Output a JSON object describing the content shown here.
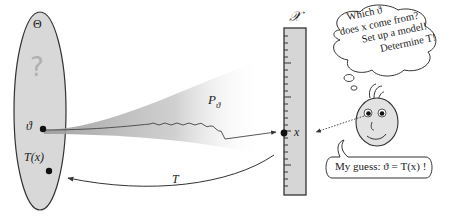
{
  "diagram": {
    "parameter_space": {
      "label": "Θ",
      "question_mark": "?",
      "theta_label": "ϑ",
      "estimate_label": "T(x)"
    },
    "model": {
      "label_main": "P",
      "label_sub": "ϑ"
    },
    "sample_space": {
      "label": "𝒳",
      "point_label": "x"
    },
    "estimator_arrow": {
      "label": "T"
    },
    "thought_bubble": {
      "lines": [
        "Which ϑ",
        "does x come from?",
        "Set up a model!",
        "Determine T!"
      ]
    },
    "speech_bubble": {
      "text": "My guess: ϑ = T(x) !"
    },
    "colors": {
      "ellipse_fill": "#d8d8d8",
      "ruler_fill": "#d6d6d6",
      "outline": "#333333",
      "face_fill": "#e2e2e2",
      "question_mark": "#b0b0b0"
    }
  }
}
